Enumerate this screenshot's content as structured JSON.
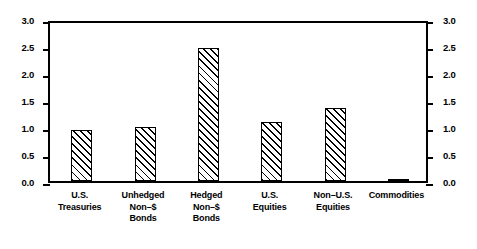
{
  "chart_data": {
    "type": "bar",
    "title": "",
    "subtitle": "",
    "xlabel": "",
    "ylabel": "",
    "ylim": [
      0.0,
      3.0
    ],
    "grid": false,
    "legend": "none",
    "y_axis_both_sides": true,
    "bar_fill": "diagonal-hatch",
    "categories": [
      "U.S. Treasuries",
      "Unhedged Non-$ Bonds",
      "Hedged Non-$ Bonds",
      "U.S. Equities",
      "Non-U.S. Equities",
      "Commodities"
    ],
    "category_lines": [
      [
        "U.S.",
        "Treasuries"
      ],
      [
        "Unhedged",
        "Non–$",
        "Bonds"
      ],
      [
        "Hedged",
        "Non–$",
        "Bonds"
      ],
      [
        "U.S.",
        "Equities"
      ],
      [
        "Non–U.S.",
        "Equities"
      ],
      [
        "Commodities"
      ]
    ],
    "values": [
      0.95,
      1.0,
      2.47,
      1.1,
      1.36,
      0.02
    ],
    "yticks": [
      0.0,
      0.5,
      1.0,
      1.5,
      2.0,
      2.5,
      3.0
    ],
    "ytick_labels": [
      "0.0",
      "0.5",
      "1.0",
      "1.5",
      "2.0",
      "2.5",
      "3.0"
    ]
  },
  "colors": {
    "axis": "#000000",
    "bar_edge": "#000000",
    "bar_face": "#ffffff",
    "background": "#ffffff"
  }
}
